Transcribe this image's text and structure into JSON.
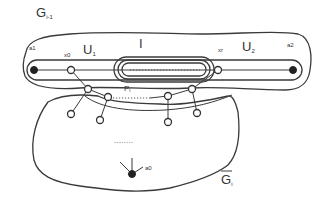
{
  "diagram": {
    "labels": {
      "g_prev": "G",
      "g_prev_sub": "i-1",
      "a1": "a1",
      "x0": "x0",
      "u1": "U",
      "u1_sub": "1",
      "i": "I",
      "xr": "xr",
      "u2": "U",
      "u2_sub": "2",
      "a2": "a2",
      "pi": "P",
      "pi_sub": "i",
      "dots": "........",
      "a0": "a0",
      "g_bar": "G",
      "g_bar_sub": "i"
    },
    "colors": {
      "stroke": "#3a3a3a",
      "node_fill": "#222222",
      "background": "#ffffff"
    }
  }
}
